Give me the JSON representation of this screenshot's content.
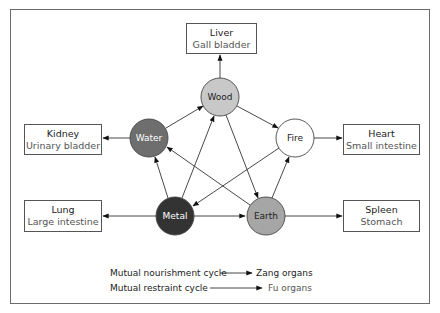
{
  "diagram": {
    "title": "",
    "elements": [
      {
        "id": "wood",
        "label": "Wood",
        "fill": "#c8c8c8",
        "text_color": "#222222",
        "cx": 220,
        "cy": 97
      },
      {
        "id": "fire",
        "label": "Fire",
        "fill": "#ffffff",
        "text_color": "#222222",
        "cx": 295,
        "cy": 138
      },
      {
        "id": "earth",
        "label": "Earth",
        "fill": "#a6a6a6",
        "text_color": "#222222",
        "cx": 266,
        "cy": 216
      },
      {
        "id": "metal",
        "label": "Metal",
        "fill": "#333333",
        "text_color": "#ffffff",
        "cx": 175,
        "cy": 216
      },
      {
        "id": "water",
        "label": "Water",
        "fill": "#6e6e6e",
        "text_color": "#ffffff",
        "cx": 149,
        "cy": 138
      }
    ],
    "organs": {
      "liver": {
        "zang": "Liver",
        "fu": "Gall bladder"
      },
      "heart": {
        "zang": "Heart",
        "fu": "Small intestine"
      },
      "spleen": {
        "zang": "Spleen",
        "fu": "Stomach"
      },
      "lung": {
        "zang": "Lung",
        "fu": "Large intestine"
      },
      "kidney": {
        "zang": "Kidney",
        "fu": "Urinary bladder"
      }
    },
    "nourishment_cycle": [
      "Wood -> Fire",
      "Fire -> Earth",
      "Earth -> Metal",
      "Metal -> Water",
      "Water -> Wood"
    ],
    "restraint_cycle": [
      "Wood -> Earth",
      "Earth -> Water",
      "Water -> Fire",
      "Fire -> Metal",
      "Metal -> Wood"
    ],
    "legend": {
      "row1_left": "Mutual nourishment cycle",
      "row1_right": "Zang organs",
      "row2_left": "Mutual restraint cycle",
      "row2_right": "Fu organs"
    }
  }
}
